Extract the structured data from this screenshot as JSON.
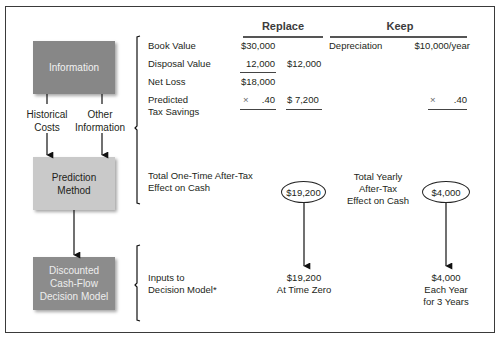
{
  "left_flow": {
    "information_box": "Information",
    "historical_costs": [
      "Historical",
      "Costs"
    ],
    "other_information": [
      "Other",
      "Information"
    ],
    "prediction_box": [
      "Prediction",
      "Method"
    ],
    "decision_box": [
      "Discounted",
      "Cash-Flow",
      "Decision Model"
    ]
  },
  "headers": {
    "replace": "Replace",
    "keep": "Keep"
  },
  "information_rows": {
    "book_value": {
      "label": "Book Value",
      "replace_a": "$30,000"
    },
    "disposal_value": {
      "label": "Disposal Value",
      "replace_a": "12,000",
      "replace_b": "$12,000"
    },
    "net_loss": {
      "label": "Net Loss",
      "replace_a": "$18,000"
    },
    "predicted_tax_savings": {
      "label": [
        "Predicted",
        "Tax Savings"
      ],
      "replace_a_sign": "×",
      "replace_a": ".40",
      "replace_b": "$ 7,200",
      "keep_sign": "×",
      "keep_value": ".40"
    },
    "depreciation": {
      "label": "Depreciation",
      "value": "$10,000/year"
    }
  },
  "prediction_rows": {
    "replace_label": [
      "Total One-Time After-Tax",
      "Effect on Cash"
    ],
    "replace_value": "$19,200",
    "keep_label": [
      "Total Yearly",
      "After-Tax",
      "Effect on Cash"
    ],
    "keep_value": "$4,000"
  },
  "decision_rows": {
    "label": [
      "Inputs to",
      "Decision Model*"
    ],
    "replace_output": [
      "$19,200",
      "At Time Zero"
    ],
    "keep_output": [
      "$4,000",
      "Each Year",
      "for 3 Years"
    ]
  }
}
